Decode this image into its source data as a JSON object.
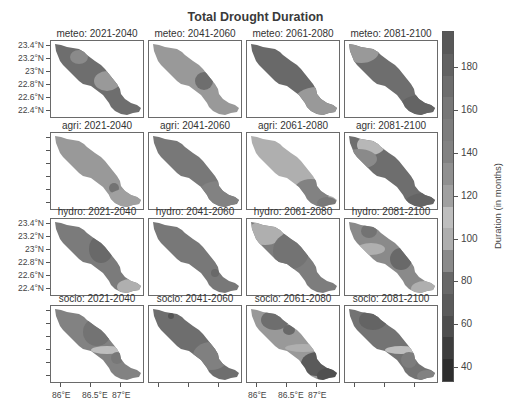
{
  "chart_data": {
    "type": "heatmap",
    "title": "Total Drought Duration",
    "layout": {
      "rows": 4,
      "cols": 4
    },
    "row_labels": [
      "meteo",
      "agri",
      "hydro",
      "socio"
    ],
    "col_labels": [
      "2021-2040",
      "2041-2060",
      "2061-2080",
      "2081-2100"
    ],
    "panels": [
      {
        "title": "meteo: 2021-2040",
        "base_value": 170,
        "zones": [
          {
            "cx": 28,
            "cy": 16,
            "rx": 9,
            "ry": 7,
            "value": 135
          },
          {
            "cx": 56,
            "cy": 40,
            "rx": 13,
            "ry": 10,
            "value": 125
          }
        ]
      },
      {
        "title": "meteo: 2041-2060",
        "base_value": 125,
        "zones": [
          {
            "cx": 55,
            "cy": 40,
            "rx": 9,
            "ry": 9,
            "value": 170
          }
        ]
      },
      {
        "title": "meteo: 2061-2080",
        "base_value": 175,
        "zones": [
          {
            "cx": 70,
            "cy": 62,
            "rx": 24,
            "ry": 16,
            "value": 125
          }
        ]
      },
      {
        "title": "meteo: 2081-2100",
        "base_value": 170,
        "zones": [
          {
            "cx": 16,
            "cy": 10,
            "rx": 18,
            "ry": 12,
            "value": 125
          },
          {
            "cx": 75,
            "cy": 66,
            "rx": 20,
            "ry": 12,
            "value": 180
          }
        ]
      },
      {
        "title": "agri: 2021-2040",
        "base_value": 125,
        "zones": [
          {
            "cx": 63,
            "cy": 55,
            "rx": 5,
            "ry": 5,
            "value": 165
          },
          {
            "cx": 75,
            "cy": 66,
            "rx": 18,
            "ry": 10,
            "value": 120
          }
        ]
      },
      {
        "title": "agri: 2041-2060",
        "base_value": 160,
        "zones": [
          {
            "cx": 70,
            "cy": 62,
            "rx": 22,
            "ry": 14,
            "value": 140
          }
        ]
      },
      {
        "title": "agri: 2061-2080",
        "base_value": 100,
        "zones": [
          {
            "cx": 64,
            "cy": 60,
            "rx": 18,
            "ry": 14,
            "value": 140
          },
          {
            "cx": 80,
            "cy": 70,
            "rx": 10,
            "ry": 6,
            "value": 160
          }
        ]
      },
      {
        "title": "agri: 2081-2100",
        "base_value": 170,
        "zones": [
          {
            "cx": 26,
            "cy": 12,
            "rx": 14,
            "ry": 10,
            "value": 105
          },
          {
            "cx": 14,
            "cy": 26,
            "rx": 18,
            "ry": 10,
            "value": 135
          },
          {
            "cx": 80,
            "cy": 70,
            "rx": 20,
            "ry": 10,
            "value": 180
          }
        ]
      },
      {
        "title": "hydro: 2021-2040",
        "base_value": 155,
        "zones": [
          {
            "cx": 50,
            "cy": 30,
            "rx": 12,
            "ry": 14,
            "value": 175
          },
          {
            "cx": 80,
            "cy": 68,
            "rx": 14,
            "ry": 8,
            "value": 115
          }
        ]
      },
      {
        "title": "hydro: 2041-2060",
        "base_value": 160,
        "zones": [
          {
            "cx": 66,
            "cy": 54,
            "rx": 4,
            "ry": 4,
            "value": 175
          }
        ]
      },
      {
        "title": "hydro: 2061-2080",
        "base_value": 150,
        "zones": [
          {
            "cx": 18,
            "cy": 14,
            "rx": 18,
            "ry": 12,
            "value": 100
          },
          {
            "cx": 44,
            "cy": 32,
            "rx": 18,
            "ry": 18,
            "value": 165
          }
        ]
      },
      {
        "title": "hydro: 2081-2100",
        "base_value": 135,
        "zones": [
          {
            "cx": 24,
            "cy": 12,
            "rx": 8,
            "ry": 7,
            "value": 165
          },
          {
            "cx": 26,
            "cy": 30,
            "rx": 14,
            "ry": 6,
            "value": 100
          },
          {
            "cx": 56,
            "cy": 40,
            "rx": 11,
            "ry": 11,
            "value": 175
          },
          {
            "cx": 80,
            "cy": 70,
            "rx": 14,
            "ry": 8,
            "value": 100
          }
        ]
      },
      {
        "title": "socio: 2021-2040",
        "base_value": 140,
        "zones": [
          {
            "cx": 46,
            "cy": 26,
            "rx": 14,
            "ry": 14,
            "value": 165
          },
          {
            "cx": 56,
            "cy": 44,
            "rx": 16,
            "ry": 4,
            "value": 110
          },
          {
            "cx": 66,
            "cy": 52,
            "rx": 6,
            "ry": 6,
            "value": 160
          }
        ]
      },
      {
        "title": "socio: 2041-2060",
        "base_value": 170,
        "zones": [
          {
            "cx": 22,
            "cy": 10,
            "rx": 3,
            "ry": 3,
            "value": 195
          },
          {
            "cx": 62,
            "cy": 50,
            "rx": 18,
            "ry": 14,
            "value": 145
          }
        ]
      },
      {
        "title": "socio: 2061-2080",
        "base_value": 125,
        "zones": [
          {
            "cx": 28,
            "cy": 14,
            "rx": 14,
            "ry": 10,
            "value": 170
          },
          {
            "cx": 42,
            "cy": 24,
            "rx": 6,
            "ry": 5,
            "value": 175
          },
          {
            "cx": 56,
            "cy": 42,
            "rx": 18,
            "ry": 4,
            "value": 100
          },
          {
            "cx": 70,
            "cy": 58,
            "rx": 16,
            "ry": 12,
            "value": 190
          },
          {
            "cx": 82,
            "cy": 70,
            "rx": 12,
            "ry": 8,
            "value": 205
          }
        ]
      },
      {
        "title": "socio: 2081-2100",
        "base_value": 165,
        "zones": [
          {
            "cx": 28,
            "cy": 14,
            "rx": 14,
            "ry": 10,
            "value": 180
          },
          {
            "cx": 56,
            "cy": 44,
            "rx": 16,
            "ry": 4,
            "value": 110
          },
          {
            "cx": 64,
            "cy": 54,
            "rx": 8,
            "ry": 8,
            "value": 150
          },
          {
            "cx": 82,
            "cy": 70,
            "rx": 10,
            "ry": 6,
            "value": 140
          }
        ]
      }
    ],
    "yaxis": {
      "ticks": [
        "23.4°N",
        "23.2°N",
        "23°N",
        "22.8°N",
        "22.6°N",
        "22.4°N"
      ]
    },
    "xaxis": {
      "ticks": [
        "86°E",
        "86.5°E",
        "87°E"
      ]
    },
    "colorbar": {
      "label": "Duration (in months)",
      "ticks": [
        180,
        160,
        140,
        120,
        100,
        80,
        60,
        40
      ],
      "range": [
        33,
        197
      ]
    }
  },
  "caption": "FIGURE 7 | ..."
}
